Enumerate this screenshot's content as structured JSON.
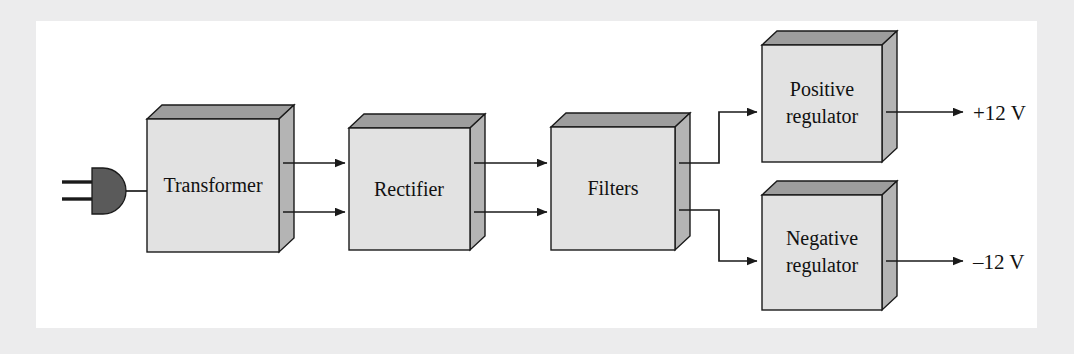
{
  "figure": {
    "type": "block-diagram",
    "background_color": "#ececed",
    "paper_color": "#ffffff",
    "box_front_color": "#e2e2e2",
    "box_top_color": "#9d9d9d",
    "box_side_color": "#b4b4b4",
    "line_color": "#1a1a1a"
  },
  "source": {
    "name": "ac-power-plug",
    "icon": "power-plug-icon",
    "color": "#5a5a5a"
  },
  "blocks": [
    {
      "id": "transformer",
      "label": "Transformer",
      "lines": [
        "Transformer"
      ]
    },
    {
      "id": "rectifier",
      "label": "Rectifier",
      "lines": [
        "Rectifier"
      ]
    },
    {
      "id": "filters",
      "label": "Filters",
      "lines": [
        "Filters"
      ]
    },
    {
      "id": "positive-regulator",
      "label": "Positive regulator",
      "lines": [
        "Positive",
        "regulator"
      ]
    },
    {
      "id": "negative-regulator",
      "label": "Negative regulator",
      "lines": [
        "Negative",
        "regulator"
      ]
    }
  ],
  "outputs": [
    {
      "id": "positive-output",
      "label": "+12 V"
    },
    {
      "id": "negative-output",
      "label": "–12 V"
    }
  ],
  "connections": [
    {
      "from": "ac-power-plug",
      "to": "transformer",
      "arrow": false
    },
    {
      "from": "transformer",
      "to": "rectifier",
      "arrow": true,
      "count": 2
    },
    {
      "from": "rectifier",
      "to": "filters",
      "arrow": true,
      "count": 2
    },
    {
      "from": "filters",
      "to": "positive-regulator",
      "arrow": true
    },
    {
      "from": "filters",
      "to": "negative-regulator",
      "arrow": true
    },
    {
      "from": "positive-regulator",
      "to": "positive-output",
      "arrow": true
    },
    {
      "from": "negative-regulator",
      "to": "negative-output",
      "arrow": true
    }
  ]
}
